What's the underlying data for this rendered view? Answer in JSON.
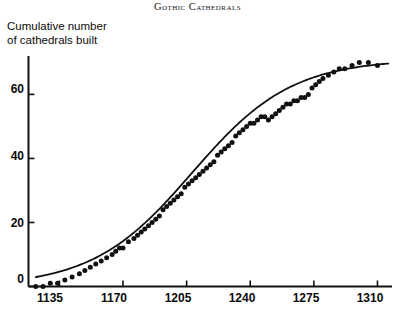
{
  "chart_data": {
    "type": "scatter",
    "title": "Gothic Cathedrals",
    "ylabel": "Cumulative number\nof cathedrals built",
    "xlabel": "",
    "xlim": [
      1118,
      1318
    ],
    "ylim": [
      0,
      72
    ],
    "grid": false,
    "legend": null,
    "xticks": [
      1135,
      1170,
      1205,
      1240,
      1275,
      1310
    ],
    "xtick_labels": [
      "1135",
      "1170",
      "1205",
      "1240",
      "1275",
      "1310"
    ],
    "yticks": [
      0,
      20,
      40,
      60
    ],
    "ytick_labels": [
      "0",
      "20",
      "40",
      "60"
    ],
    "series": [
      {
        "name": "Cumulative cathedrals built",
        "marker": "filled-circle",
        "color": "#101010",
        "points": [
          [
            1122,
            0
          ],
          [
            1126,
            0
          ],
          [
            1130,
            1
          ],
          [
            1134,
            1
          ],
          [
            1138,
            2
          ],
          [
            1142,
            3
          ],
          [
            1146,
            4
          ],
          [
            1149,
            5
          ],
          [
            1152,
            6
          ],
          [
            1155,
            7
          ],
          [
            1158,
            8
          ],
          [
            1161,
            9
          ],
          [
            1164,
            10
          ],
          [
            1166,
            11
          ],
          [
            1168,
            12
          ],
          [
            1170,
            12
          ],
          [
            1173,
            14
          ],
          [
            1176,
            15
          ],
          [
            1178,
            16
          ],
          [
            1180,
            17
          ],
          [
            1182,
            18
          ],
          [
            1184,
            19
          ],
          [
            1186,
            20
          ],
          [
            1188,
            21
          ],
          [
            1190,
            22
          ],
          [
            1192,
            24
          ],
          [
            1194,
            25
          ],
          [
            1196,
            26
          ],
          [
            1198,
            27
          ],
          [
            1200,
            28
          ],
          [
            1202,
            29
          ],
          [
            1204,
            31
          ],
          [
            1206,
            32
          ],
          [
            1208,
            33
          ],
          [
            1210,
            34
          ],
          [
            1212,
            35
          ],
          [
            1214,
            36
          ],
          [
            1216,
            37
          ],
          [
            1218,
            38
          ],
          [
            1220,
            39
          ],
          [
            1222,
            41
          ],
          [
            1224,
            42
          ],
          [
            1226,
            43
          ],
          [
            1228,
            44
          ],
          [
            1230,
            45
          ],
          [
            1232,
            47
          ],
          [
            1234,
            48
          ],
          [
            1236,
            49
          ],
          [
            1238,
            50
          ],
          [
            1240,
            51
          ],
          [
            1242,
            51
          ],
          [
            1244,
            52
          ],
          [
            1246,
            53
          ],
          [
            1248,
            53
          ],
          [
            1250,
            52
          ],
          [
            1252,
            53
          ],
          [
            1254,
            54
          ],
          [
            1256,
            55
          ],
          [
            1258,
            56
          ],
          [
            1260,
            57
          ],
          [
            1262,
            57
          ],
          [
            1264,
            58
          ],
          [
            1266,
            58
          ],
          [
            1268,
            59
          ],
          [
            1270,
            59
          ],
          [
            1272,
            60
          ],
          [
            1274,
            62
          ],
          [
            1276,
            63
          ],
          [
            1278,
            64
          ],
          [
            1280,
            65
          ],
          [
            1283,
            66
          ],
          [
            1286,
            67
          ],
          [
            1289,
            68
          ],
          [
            1292,
            68
          ],
          [
            1296,
            69
          ],
          [
            1300,
            70
          ],
          [
            1305,
            70
          ],
          [
            1310,
            69
          ]
        ]
      }
    ],
    "fit_curve": {
      "name": "logistic fit",
      "type": "logistic",
      "color": "#101010",
      "L": 71,
      "k": 0.0365,
      "x0": 1208,
      "x_range": [
        1122,
        1316
      ]
    }
  }
}
